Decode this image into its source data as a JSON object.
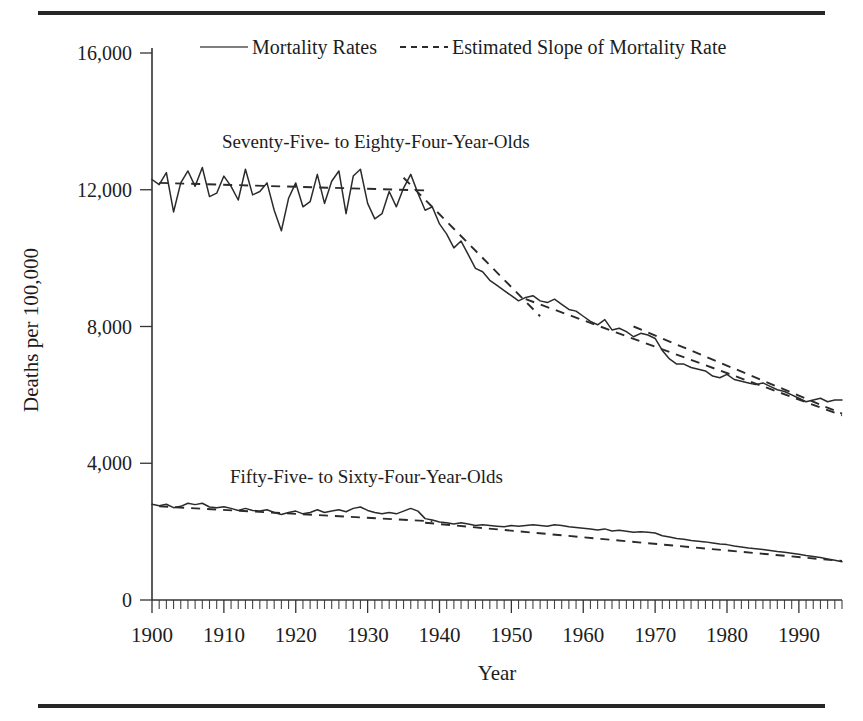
{
  "figure": {
    "name": "mortality-rates-by-age-group",
    "has_top_rule": true,
    "has_bottom_rule": true
  },
  "legend": {
    "position": "top-center",
    "entries": [
      {
        "label": "Mortality Rates",
        "style": "solid"
      },
      {
        "label": "Estimated Slope of Mortality Rate",
        "style": "dashed"
      }
    ]
  },
  "annotations": [
    {
      "id": "upper-series-label",
      "text": "Seventy-Five- to Eighty-Four-Year-Olds",
      "x": 1907,
      "y": 13450
    },
    {
      "id": "lower-series-label",
      "text": "Fifty-Five- to Sixty-Four-Year-Olds",
      "x": 1908,
      "y": 3650
    }
  ],
  "chart_data": {
    "type": "line",
    "title": "",
    "xlabel": "Year",
    "ylabel": "Deaths per 100,000",
    "xlim": [
      1900,
      1996
    ],
    "ylim": [
      0,
      16000
    ],
    "yticks": [
      0,
      4000,
      8000,
      12000,
      16000
    ],
    "ytick_labels": [
      "0",
      "4,000",
      "8,000",
      "12,000",
      "16,000"
    ],
    "xticks": [
      1900,
      1910,
      1920,
      1930,
      1940,
      1950,
      1960,
      1970,
      1980,
      1990
    ],
    "xtick_labels": [
      "1900",
      "1910",
      "1920",
      "1930",
      "1940",
      "1950",
      "1960",
      "1970",
      "1980",
      "1990"
    ],
    "x_minor_tick_interval": 1,
    "grid": false,
    "series": [
      {
        "name": "Seventy-Five- to Eighty-Four-Year-Olds",
        "style": "solid",
        "x": [
          1900,
          1901,
          1902,
          1903,
          1904,
          1905,
          1906,
          1907,
          1908,
          1909,
          1910,
          1911,
          1912,
          1913,
          1914,
          1915,
          1916,
          1917,
          1918,
          1919,
          1920,
          1921,
          1922,
          1923,
          1924,
          1925,
          1926,
          1927,
          1928,
          1929,
          1930,
          1931,
          1932,
          1933,
          1934,
          1935,
          1936,
          1937,
          1938,
          1939,
          1940,
          1941,
          1942,
          1943,
          1944,
          1945,
          1946,
          1947,
          1948,
          1949,
          1950,
          1951,
          1952,
          1953,
          1954,
          1955,
          1956,
          1957,
          1958,
          1959,
          1960,
          1961,
          1962,
          1963,
          1964,
          1965,
          1966,
          1967,
          1968,
          1969,
          1970,
          1971,
          1972,
          1973,
          1974,
          1975,
          1976,
          1977,
          1978,
          1979,
          1980,
          1981,
          1982,
          1983,
          1984,
          1985,
          1986,
          1987,
          1988,
          1989,
          1990,
          1991,
          1992,
          1993,
          1994,
          1995,
          1996
        ],
        "y": [
          12300,
          12150,
          12500,
          11350,
          12200,
          12550,
          12100,
          12650,
          11800,
          11900,
          12400,
          12100,
          11700,
          12600,
          11850,
          11950,
          12200,
          11400,
          10800,
          11750,
          12200,
          11500,
          11650,
          12450,
          11600,
          12250,
          12550,
          11300,
          12400,
          12600,
          11600,
          11150,
          11300,
          11950,
          11500,
          12050,
          12450,
          11900,
          11400,
          11500,
          11000,
          10700,
          10300,
          10500,
          10100,
          9700,
          9600,
          9350,
          9200,
          9050,
          8900,
          8750,
          8850,
          8900,
          8750,
          8700,
          8800,
          8650,
          8500,
          8450,
          8300,
          8150,
          8050,
          8200,
          7900,
          7950,
          7850,
          7700,
          7800,
          7750,
          7650,
          7300,
          7050,
          6900,
          6900,
          6800,
          6750,
          6700,
          6550,
          6500,
          6600,
          6450,
          6400,
          6350,
          6300,
          6350,
          6250,
          6150,
          6100,
          6000,
          5900,
          5800,
          5850,
          5900,
          5800,
          5850,
          5850
        ]
      },
      {
        "name": "Fifty-Five- to Sixty-Four-Year-Olds",
        "style": "solid",
        "x": [
          1900,
          1901,
          1902,
          1903,
          1904,
          1905,
          1906,
          1907,
          1908,
          1909,
          1910,
          1911,
          1912,
          1913,
          1914,
          1915,
          1916,
          1917,
          1918,
          1919,
          1920,
          1921,
          1922,
          1923,
          1924,
          1925,
          1926,
          1927,
          1928,
          1929,
          1930,
          1931,
          1932,
          1933,
          1934,
          1935,
          1936,
          1937,
          1938,
          1939,
          1940,
          1941,
          1942,
          1943,
          1944,
          1945,
          1946,
          1947,
          1948,
          1949,
          1950,
          1951,
          1952,
          1953,
          1954,
          1955,
          1956,
          1957,
          1958,
          1959,
          1960,
          1961,
          1962,
          1963,
          1964,
          1965,
          1966,
          1967,
          1968,
          1969,
          1970,
          1971,
          1972,
          1973,
          1974,
          1975,
          1976,
          1977,
          1978,
          1979,
          1980,
          1981,
          1982,
          1983,
          1984,
          1985,
          1986,
          1987,
          1988,
          1989,
          1990,
          1991,
          1992,
          1993,
          1994,
          1995,
          1996
        ],
        "y": [
          2800,
          2760,
          2800,
          2700,
          2740,
          2830,
          2790,
          2830,
          2720,
          2700,
          2730,
          2680,
          2620,
          2680,
          2620,
          2600,
          2640,
          2560,
          2500,
          2560,
          2600,
          2520,
          2560,
          2640,
          2560,
          2600,
          2640,
          2580,
          2680,
          2720,
          2620,
          2560,
          2520,
          2560,
          2520,
          2600,
          2680,
          2600,
          2380,
          2340,
          2280,
          2260,
          2220,
          2260,
          2220,
          2180,
          2200,
          2180,
          2160,
          2140,
          2180,
          2160,
          2180,
          2200,
          2180,
          2160,
          2200,
          2180,
          2140,
          2120,
          2100,
          2080,
          2050,
          2080,
          2020,
          2040,
          2010,
          1980,
          2000,
          1980,
          1960,
          1880,
          1840,
          1800,
          1780,
          1740,
          1720,
          1700,
          1670,
          1640,
          1620,
          1580,
          1550,
          1520,
          1500,
          1480,
          1450,
          1420,
          1400,
          1370,
          1340,
          1300,
          1270,
          1240,
          1200,
          1160,
          1120
        ]
      }
    ],
    "trend_segments": [
      {
        "series": "Seventy-Five- to Eighty-Four-Year-Olds",
        "x_start": 1901,
        "x_end": 1938,
        "y_start": 12200,
        "y_end": 11980
      },
      {
        "series": "Seventy-Five- to Eighty-Four-Year-Olds",
        "x_start": 1935,
        "x_end": 1954,
        "y_start": 12350,
        "y_end": 8300
      },
      {
        "series": "Seventy-Five- to Eighty-Four-Year-Olds",
        "x_start": 1952,
        "x_end": 1996,
        "y_start": 8800,
        "y_end": 5400
      },
      {
        "series": "Seventy-Five- to Eighty-Four-Year-Olds",
        "x_start": 1967,
        "x_end": 1996,
        "y_start": 8000,
        "y_end": 5450
      },
      {
        "series": "Fifty-Five- to Sixty-Four-Year-Olds",
        "x_start": 1901,
        "x_end": 1939,
        "y_start": 2740,
        "y_end": 2300
      },
      {
        "series": "Fifty-Five- to Sixty-Four-Year-Olds",
        "x_start": 1938,
        "x_end": 1996,
        "y_start": 2260,
        "y_end": 1140
      }
    ]
  }
}
